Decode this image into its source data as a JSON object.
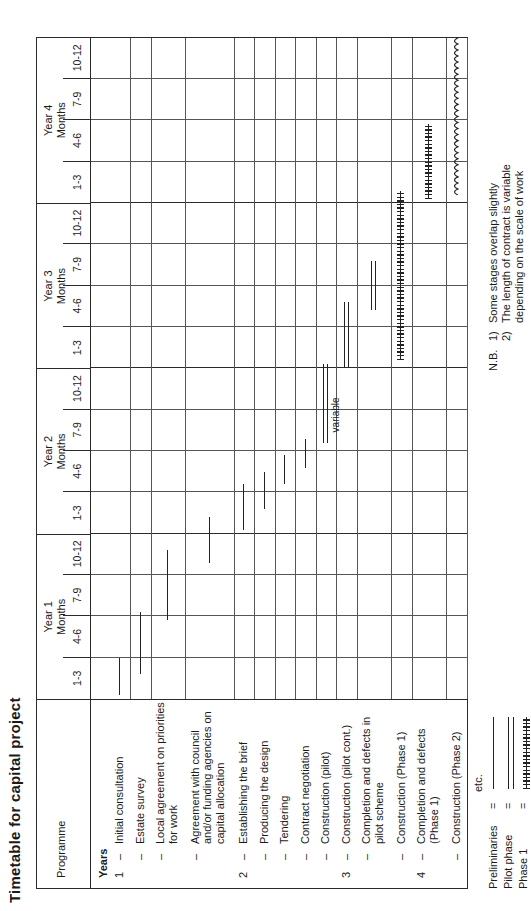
{
  "title": "Timetable for capital project",
  "table": {
    "programme_header": "Programme",
    "years_header": "Years",
    "year_groups": [
      {
        "year": "Year 1",
        "months_label": "Months",
        "quarters": [
          "1-3",
          "4-6",
          "7-9",
          "10-12"
        ]
      },
      {
        "year": "Year 2",
        "months_label": "Months",
        "quarters": [
          "1-3",
          "4-6",
          "7-9",
          "10-12"
        ]
      },
      {
        "year": "Year 3",
        "months_label": "Months",
        "quarters": [
          "1-3",
          "4-6",
          "7-9",
          "10-12"
        ]
      },
      {
        "year": "Year 4",
        "months_label": "Months",
        "quarters": [
          "1-3",
          "4-6",
          "7-9",
          "10-12"
        ]
      }
    ],
    "tasks": [
      {
        "year": "1",
        "dash": "–",
        "label": "Initial consultation"
      },
      {
        "year": "",
        "dash": "–",
        "label": "Estate survey"
      },
      {
        "year": "",
        "dash": "–",
        "label": "Local agreement on priorities for work"
      },
      {
        "year": "",
        "dash": "–",
        "label": "Agreement with council and/or funding agencies on capital allocation"
      },
      {
        "year": "2",
        "dash": "–",
        "label": "Establishing the brief"
      },
      {
        "year": "",
        "dash": "–",
        "label": "Producing the design"
      },
      {
        "year": "",
        "dash": "–",
        "label": "Tendering"
      },
      {
        "year": "",
        "dash": "–",
        "label": "Contract negotiation"
      },
      {
        "year": "",
        "dash": "–",
        "label": "Construction (pilot)"
      },
      {
        "year": "3",
        "dash": "–",
        "label": "Construction (pilot cont.)"
      },
      {
        "year": "",
        "dash": "–",
        "label": "Completion and defects in pilot scheme"
      },
      {
        "year": "",
        "dash": "–",
        "label": "Construction (Phase 1)"
      },
      {
        "year": "4",
        "dash": "–",
        "label": "Completion and defects (Phase 1)"
      },
      {
        "year": "",
        "dash": "–",
        "label": "Construction (Phase 2)"
      }
    ],
    "etc_label": "etc.",
    "variable_label": "variable"
  },
  "legend": {
    "equals": "=",
    "items": [
      {
        "label": "Preliminaries",
        "style": "single-line"
      },
      {
        "label": "Pilot phase",
        "style": "double-line"
      },
      {
        "label": "Phase 1",
        "style": "hatched-line"
      },
      {
        "label": "Phase 2",
        "style": "wavy-line"
      }
    ]
  },
  "notes": {
    "prefix": "N.B.",
    "items": [
      {
        "num": "1)",
        "text": "Some stages overlap slightly"
      },
      {
        "num": "2)",
        "text": "The length of contract is variable"
      },
      {
        "num": "",
        "text": "depending on the scale of work"
      }
    ]
  },
  "chart_data": {
    "type": "bar",
    "title": "Timetable for capital project",
    "xlabel": "Months",
    "ylabel": "Programme",
    "categories": [
      "Initial consultation",
      "Estate survey",
      "Local agreement on priorities for work",
      "Agreement with council and/or funding agencies on capital allocation",
      "Establishing the brief",
      "Producing the design",
      "Tendering",
      "Contract negotiation",
      "Construction (pilot)",
      "Construction (pilot cont.)",
      "Completion and defects in pilot scheme",
      "Construction (Phase 1)",
      "Completion and defects (Phase 1)",
      "Construction (Phase 2)"
    ],
    "x_ticks": [
      "Y1 1-3",
      "Y1 4-6",
      "Y1 7-9",
      "Y1 10-12",
      "Y2 1-3",
      "Y2 4-6",
      "Y2 7-9",
      "Y2 10-12",
      "Y3 1-3",
      "Y3 4-6",
      "Y3 7-9",
      "Y3 10-12",
      "Y4 1-3",
      "Y4 4-6",
      "Y4 7-9",
      "Y4 10-12"
    ],
    "xlim": [
      0,
      16
    ],
    "grid": true,
    "legend_position": "below-left",
    "series": [
      {
        "name": "Preliminaries",
        "style": "single-line"
      },
      {
        "name": "Pilot phase",
        "style": "double-line"
      },
      {
        "name": "Phase 1",
        "style": "hatched-line"
      },
      {
        "name": "Phase 2",
        "style": "wavy-line"
      }
    ],
    "bars": [
      {
        "task": "Initial consultation",
        "start_quarter": 0.1,
        "end_quarter": 1.0,
        "style": "single-line"
      },
      {
        "task": "Estate survey",
        "start_quarter": 0.6,
        "end_quarter": 2.1,
        "style": "single-line"
      },
      {
        "task": "Local agreement on priorities for work",
        "start_quarter": 1.9,
        "end_quarter": 3.6,
        "style": "single-line"
      },
      {
        "task": "Agreement with council and/or funding agencies on capital allocation",
        "start_quarter": 3.3,
        "end_quarter": 4.4,
        "style": "single-line"
      },
      {
        "task": "Establishing the brief",
        "start_quarter": 4.1,
        "end_quarter": 5.2,
        "style": "single-line"
      },
      {
        "task": "Producing the design",
        "start_quarter": 4.6,
        "end_quarter": 5.5,
        "style": "single-line"
      },
      {
        "task": "Tendering",
        "start_quarter": 5.2,
        "end_quarter": 5.9,
        "style": "single-line"
      },
      {
        "task": "Contract negotiation",
        "start_quarter": 5.6,
        "end_quarter": 6.3,
        "style": "single-line"
      },
      {
        "task": "Construction (pilot)",
        "start_quarter": 6.2,
        "end_quarter": 8.1,
        "style": "double-line"
      },
      {
        "task": "Construction (pilot cont.)",
        "start_quarter": 8.0,
        "end_quarter": 9.6,
        "style": "double-line"
      },
      {
        "task": "Completion and defects in pilot scheme",
        "start_quarter": 9.4,
        "end_quarter": 10.6,
        "style": "double-line"
      },
      {
        "task": "Construction (Phase 1)",
        "start_quarter": 8.2,
        "end_quarter": 12.3,
        "style": "hatched-line"
      },
      {
        "task": "Completion and defects (Phase 1)",
        "start_quarter": 12.1,
        "end_quarter": 13.9,
        "style": "hatched-line"
      },
      {
        "task": "Construction (Phase 2)",
        "start_quarter": 12.2,
        "end_quarter": 16.0,
        "style": "wavy-line"
      }
    ]
  }
}
